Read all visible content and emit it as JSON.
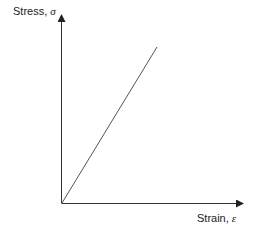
{
  "diagram": {
    "y_axis_label": "Stress, ",
    "y_axis_symbol": "σ",
    "x_axis_label": "Strain, ",
    "x_axis_symbol": "ε",
    "line_color": "#555555",
    "axis_color": "#333333"
  }
}
